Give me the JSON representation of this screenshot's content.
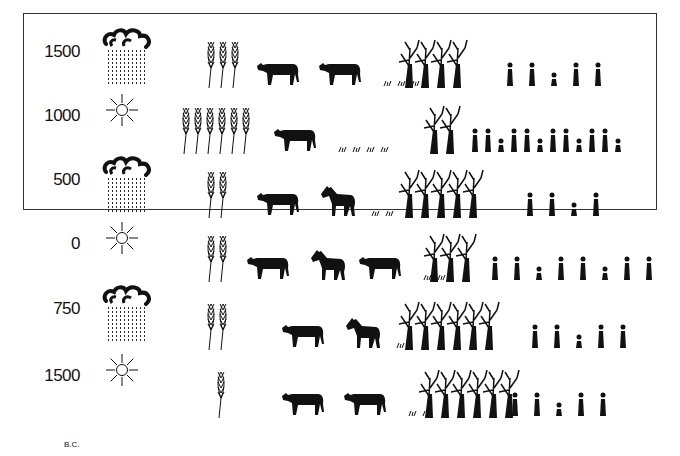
{
  "diagram": {
    "era_label": "B.C.",
    "rows": [
      {
        "year": "1500",
        "weather": "rain",
        "wheat": 3,
        "animals": [
          "cow",
          "cow"
        ],
        "grass_tufts": 3,
        "trees": 4,
        "people_groups": 5
      },
      {
        "year": "1000",
        "weather": "sun",
        "wheat": 6,
        "animals": [
          "cow"
        ],
        "grass_tufts": 4,
        "trees": 2,
        "people_groups": 12
      },
      {
        "year": "500",
        "weather": "rain",
        "wheat": 2,
        "animals": [
          "cow",
          "horse"
        ],
        "grass_tufts": 2,
        "trees": 5,
        "people_groups": 4
      },
      {
        "year": "0",
        "weather": "sun",
        "wheat": 2,
        "animals": [
          "cow",
          "horse",
          "cow"
        ],
        "grass_tufts": 2,
        "trees": 3,
        "people_groups": 8
      },
      {
        "year": "750",
        "weather": "rain",
        "wheat": 2,
        "animals": [
          "cow",
          "horse"
        ],
        "grass_tufts": 1,
        "trees": 6,
        "people_groups": 5
      },
      {
        "year": "1500",
        "weather": "sun",
        "wheat": 1,
        "animals": [
          "cow",
          "cow"
        ],
        "grass_tufts": 2,
        "trees": 6,
        "people_groups": 5
      }
    ]
  },
  "colors": {
    "ink": "#111111",
    "border": "#333333",
    "background": "#ffffff"
  }
}
